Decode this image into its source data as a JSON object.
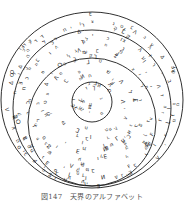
{
  "caption": "図147　天界のアルファベット",
  "diagram": {
    "stroke_color": "#1a1a1a",
    "glyph_color": "#222222",
    "rings": [
      {
        "name": "outer-ring",
        "cx": 92,
        "cy": 100,
        "rx": 91,
        "ry": 88
      },
      {
        "name": "second-ring",
        "cx": 92,
        "cy": 108,
        "rx": 79,
        "ry": 78
      },
      {
        "name": "third-ring",
        "cx": 92,
        "cy": 122,
        "rx": 64,
        "ry": 64
      },
      {
        "name": "inner-circle",
        "cx": 92,
        "cy": 102,
        "rx": 20,
        "ry": 20
      }
    ],
    "glyph_set": "ב ג ד ה ו ז ח ט י כ ל מ נ ס ע פ צ ק ר ש ת Δ Ⅎ Ʌ Ⴈ ⅃ ⴷ ⴺ ⴹ ⵎ ⵍ ⵏ ⵓ ⵔ"
  }
}
